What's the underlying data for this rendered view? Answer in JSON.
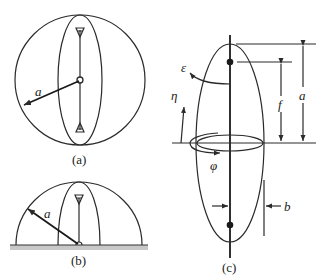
{
  "figure": {
    "panels": [
      {
        "id": "a",
        "caption": "(a)",
        "description": "Spherical (full-circle) radome/structure of radius a with vertical dipole antenna at center",
        "radius_label": "a"
      },
      {
        "id": "b",
        "caption": "(b)",
        "description": "Hemispherical structure of radius a over ground plane with monopole antenna",
        "radius_label": "a"
      },
      {
        "id": "c",
        "caption": "(c)",
        "description": "Prolate spheroid with semi-major axis a, semi-minor axis b, focal distance f, and coordinate arrows",
        "labels": {
          "epsilon": "ε",
          "eta": "η",
          "phi": "φ",
          "f": "f",
          "a": "a",
          "b": "b"
        }
      }
    ]
  },
  "colors": {
    "line": "#2a2a2a",
    "ground": "#c8c8c8",
    "background": "#ffffff"
  }
}
